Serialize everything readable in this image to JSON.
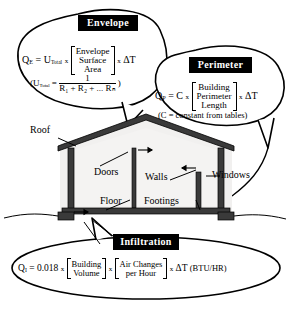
{
  "diagram": {
    "colors": {
      "chip_background": "#000000",
      "chip_text": "#ffffff",
      "ink": "#000000",
      "house_fill": "#f1f0ef",
      "structure_dark": "#3a3a3a",
      "page_background": "#ffffff"
    }
  },
  "callouts": {
    "envelope": {
      "chip_label": "Envelope",
      "equation": {
        "lhs": "Q",
        "lhs_sub": "E",
        "eq_sign": "=",
        "factor1": "U",
        "factor1_sub": "Total",
        "times1": "x",
        "bracket_lines": [
          "Envelope",
          "Surface",
          "Area"
        ],
        "times2": "x",
        "delta_t": "ΔT"
      },
      "sub_equation": {
        "open_paren": "(",
        "symbol": "U",
        "symbol_sub": "Total",
        "eq_sign": "=",
        "numerator": "1",
        "denominator_terms": [
          "R",
          "1",
          "R",
          "2",
          "R",
          "n"
        ],
        "denominator_text": "R₁ + R₂ + ... Rₙ",
        "close_paren": ")"
      }
    },
    "perimeter": {
      "chip_label": "Perimeter",
      "equation": {
        "lhs": "Q",
        "lhs_sub": "P",
        "eq_sign": "=",
        "factor1": "C",
        "times1": "x",
        "bracket_lines": [
          "Building",
          "Perimeter",
          "Length"
        ],
        "times2": "x",
        "delta_t": "ΔT"
      },
      "note": "(C = constant from tables)"
    },
    "infiltration": {
      "chip_label": "Infiltration",
      "equation": {
        "lhs": "Q",
        "lhs_sub": "I",
        "eq_sign": "=",
        "constant": "0.018",
        "times1": "x",
        "bracket1_lines": [
          "Building",
          "Volume"
        ],
        "times2": "x",
        "bracket2_lines": [
          "Air Changes",
          "per Hour"
        ],
        "times3": "x",
        "delta_t": "ΔT",
        "units": "(BTU/HR)"
      }
    }
  },
  "house_labels": [
    {
      "id": "roof",
      "text": "Roof"
    },
    {
      "id": "doors",
      "text": "Doors"
    },
    {
      "id": "walls",
      "text": "Walls"
    },
    {
      "id": "floor",
      "text": "Floor"
    },
    {
      "id": "footings",
      "text": "Footings"
    },
    {
      "id": "windows",
      "text": "Windows"
    }
  ]
}
